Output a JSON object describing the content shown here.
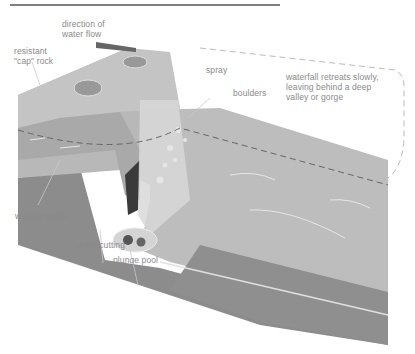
{
  "diagram": {
    "labels": {
      "direction": "direction of\nwater flow",
      "cap_rock": "resistant\n\"cap\" rock",
      "spray": "spray",
      "boulders": "boulders",
      "retreat": "waterfall retreats slowly,\nleaving behind a deep\nvalley or gorge",
      "weaker_rocks": "weaker rocks",
      "undercutting": "undercutting",
      "plunge_pool": "plunge pool"
    },
    "colors": {
      "cap_rock": "#b5b5b5",
      "weaker_rock": "#8c8c8c",
      "water": "#c9c9c9",
      "label": "#8a8a8a",
      "outline": "#a8a8a8"
    }
  }
}
